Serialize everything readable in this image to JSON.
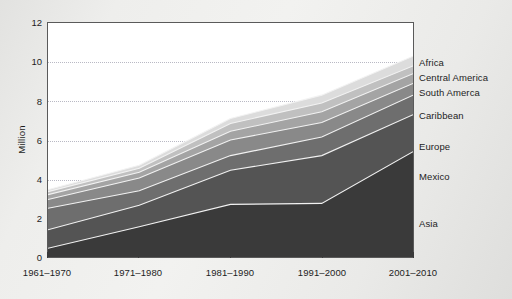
{
  "chart_data": {
    "type": "area",
    "stacked": true,
    "title": "",
    "xlabel": "",
    "ylabel": "Million",
    "categories": [
      "1961–1970",
      "1971–1980",
      "1981–1990",
      "1991–2000",
      "2001–2010"
    ],
    "ylim": [
      0,
      12
    ],
    "yticks": [
      0,
      2,
      4,
      6,
      8,
      10,
      12
    ],
    "grid": true,
    "legend_position": "right-outside",
    "series": [
      {
        "name": "Asia",
        "values": [
          0.45,
          1.55,
          2.7,
          2.75,
          5.4
        ],
        "color": "#3a3a3a"
      },
      {
        "name": "Mexico",
        "values": [
          0.95,
          1.1,
          1.75,
          2.45,
          1.9
        ],
        "color": "#545454"
      },
      {
        "name": "Europe",
        "values": [
          1.1,
          0.75,
          0.75,
          0.95,
          1.0
        ],
        "color": "#6e6e6e"
      },
      {
        "name": "Caribbean",
        "values": [
          0.45,
          0.65,
          0.8,
          0.75,
          0.6
        ],
        "color": "#898989"
      },
      {
        "name": "South Amerca",
        "values": [
          0.25,
          0.3,
          0.45,
          0.55,
          0.5
        ],
        "color": "#a4a4a4"
      },
      {
        "name": "Central America",
        "values": [
          0.15,
          0.2,
          0.4,
          0.45,
          0.4
        ],
        "color": "#c0c0c0"
      },
      {
        "name": "Africa",
        "values": [
          0.1,
          0.15,
          0.25,
          0.4,
          0.5
        ],
        "color": "#dcdcdc"
      }
    ],
    "cumulative_tops": {
      "1961–1970": [
        0.45,
        1.4,
        2.5,
        2.95,
        3.2,
        3.35,
        3.45
      ],
      "1971–1980": [
        1.55,
        2.65,
        3.4,
        4.05,
        4.35,
        4.55,
        4.7
      ],
      "1981–1990": [
        2.7,
        4.45,
        5.2,
        6.0,
        6.45,
        6.85,
        7.1
      ],
      "1991–2000": [
        2.75,
        5.2,
        6.15,
        6.9,
        7.45,
        7.9,
        8.3
      ],
      "2001–2010": [
        5.4,
        7.3,
        8.3,
        8.9,
        9.4,
        9.8,
        10.3
      ]
    }
  },
  "axes": {
    "y_title": "Million",
    "y_tick_labels": [
      "0",
      "2",
      "4",
      "6",
      "8",
      "10",
      "12"
    ],
    "x_tick_labels": [
      "1961–1970",
      "1971–1980",
      "1981–1990",
      "1991–2000",
      "2001–2010"
    ]
  },
  "legend": {
    "items": [
      {
        "label": "Africa"
      },
      {
        "label": "Central America"
      },
      {
        "label": "South Amerca"
      },
      {
        "label": "Caribbean"
      },
      {
        "label": "Europe"
      },
      {
        "label": "Mexico"
      },
      {
        "label": "Asia"
      }
    ]
  },
  "style": {
    "plot_background": "#ffffff",
    "frame_color": "#5a5a5a",
    "grid_color": "#b9b9c4",
    "page_background": "#ececea",
    "text_color": "#1d1d1d",
    "band_separator_color": "#f2f2f2"
  }
}
